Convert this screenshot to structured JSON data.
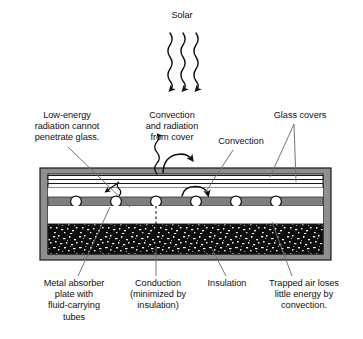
{
  "diagram": {
    "colors": {
      "text": "#111111",
      "casing": "#8c8c8c",
      "absorber_plate": "#7f7f7f",
      "insulation": "#111111",
      "air_gap": "#ffffff",
      "glass": "#ffffff",
      "leader_line": "#6e6e6e",
      "arrow": "#111111"
    },
    "labels": {
      "solar": "Solar",
      "low_energy": "Low-energy\nradiation cannot\npenetrate glass.",
      "convection_radiation_cover": "Convection\nand radiation\nfrom cover",
      "convection": "Convection",
      "glass_covers": "Glass covers",
      "metal_absorber": "Metal absorber\nplate with\nfluid-carrying\ntubes",
      "conduction": "Conduction\n(minimized by\ninsulation)",
      "insulation": "Insulation",
      "trapped_air": "Trapped air loses\nlittle energy by\nconvection."
    },
    "structure": {
      "solar_rays_count": 3,
      "glass_cover_layers": 2,
      "fluid_tubes_count": 6,
      "layers": [
        "glass cover (outer)",
        "glass cover (inner)",
        "trapped air space",
        "metal absorber plate with tubes",
        "air space",
        "insulation"
      ]
    }
  }
}
